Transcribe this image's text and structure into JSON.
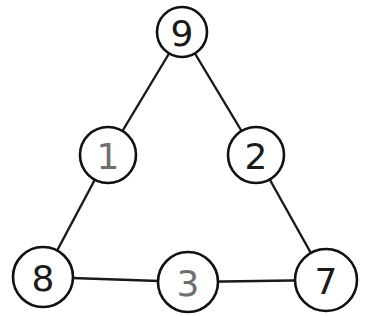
{
  "diagram": {
    "type": "number-triangle",
    "colors": {
      "given_number": "#1a1a1a",
      "filled_number": "#6f6f6f",
      "stroke": "#111111",
      "background": "#ffffff"
    },
    "nodes": [
      {
        "id": "top",
        "label": "9",
        "x": 182,
        "y": 32,
        "r": 25,
        "style": "given"
      },
      {
        "id": "left-mid",
        "label": "1",
        "x": 108,
        "y": 155,
        "r": 28,
        "style": "filled"
      },
      {
        "id": "right-mid",
        "label": "2",
        "x": 256,
        "y": 155,
        "r": 28,
        "style": "given"
      },
      {
        "id": "bottom-left",
        "label": "8",
        "x": 43,
        "y": 277,
        "r": 30,
        "style": "given"
      },
      {
        "id": "bottom-mid",
        "label": "3",
        "x": 188,
        "y": 282,
        "r": 30,
        "style": "filled"
      },
      {
        "id": "bottom-right",
        "label": "7",
        "x": 326,
        "y": 280,
        "r": 31,
        "style": "given"
      }
    ],
    "edges": [
      [
        "top",
        "left-mid"
      ],
      [
        "left-mid",
        "bottom-left"
      ],
      [
        "top",
        "right-mid"
      ],
      [
        "right-mid",
        "bottom-right"
      ],
      [
        "bottom-left",
        "bottom-mid"
      ],
      [
        "bottom-mid",
        "bottom-right"
      ]
    ]
  }
}
